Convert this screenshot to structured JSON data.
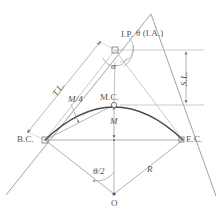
{
  "diagram": {
    "type": "surveying-curve-diagram",
    "colors": {
      "line": "#8c8c8c",
      "curve": "#4a4a4a",
      "text": "#555555",
      "background": "#ffffff"
    },
    "labels": {
      "ip": "I.P.",
      "ia": "θ (I.A.)",
      "alpha": "α",
      "sl": "S.L.",
      "tl": "T.L.",
      "m_over_4": "M/4",
      "mc": "M.C.",
      "m": "M",
      "bc": "B.C.",
      "ec": "E.C.",
      "theta_half": "θ/2",
      "r": "R",
      "o": "O"
    },
    "points": {
      "ip": {
        "name": "I.P.",
        "x": 115,
        "y": 50,
        "marker": "square"
      },
      "bc": {
        "name": "B.C.",
        "x": 45,
        "y": 140,
        "marker": "square"
      },
      "ec": {
        "name": "E.C.",
        "x": 183,
        "y": 140,
        "marker": "square"
      },
      "mc": {
        "name": "M.C.",
        "x": 114,
        "y": 105,
        "marker": "circle"
      },
      "o": {
        "name": "O",
        "x": 114,
        "y": 194,
        "marker": "dot"
      }
    },
    "dimensions": {
      "sl": {
        "label": "S.L.",
        "from_y": 50,
        "to_y": 105,
        "x": 185
      },
      "m": {
        "label": "M",
        "from_y": 105,
        "to_y": 140,
        "x": 114
      },
      "tl": {
        "label": "T.L.",
        "from": "B.C.",
        "to": "I.P."
      },
      "m_over_4": {
        "label": "M/4",
        "from": "chord",
        "to": "curve"
      },
      "r": {
        "label": "R",
        "from": "O",
        "to": "E.C."
      },
      "theta_half": {
        "label": "θ/2",
        "at": "O"
      },
      "ia": {
        "label": "θ (I.A.)",
        "at": "I.P."
      },
      "alpha": {
        "label": "α",
        "at": "I.P."
      }
    }
  }
}
